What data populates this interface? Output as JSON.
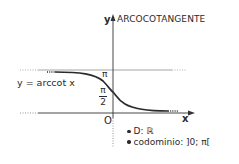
{
  "diagram": {
    "title": "ARCOCOTANGENTE",
    "y_axis_label": "y",
    "x_axis_label": "x",
    "origin_label": "O",
    "curve_label": "y = arccot x",
    "ticks": {
      "pi": "π",
      "half_pi_numerator": "π",
      "half_pi_denominator": "2"
    },
    "properties": [
      "D: ℝ",
      "codominio: ]0; π["
    ],
    "colors": {
      "curve": "#2a2a2a",
      "axis": "#333333",
      "asymptote": "#9a9a9a"
    }
  }
}
